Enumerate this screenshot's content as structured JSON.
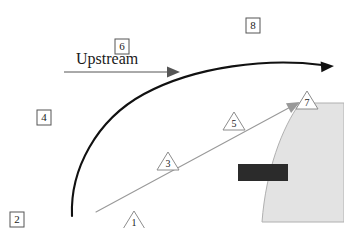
{
  "figure": {
    "type": "technical-diagram",
    "background_color": "#ffffff",
    "width": 344,
    "height": 228
  },
  "annotation_text": {
    "upstream": "Upstream"
  },
  "boxed_labels": [
    {
      "id": "box-2",
      "text": "2",
      "x": 10,
      "y": 212
    },
    {
      "id": "box-4",
      "text": "4",
      "x": 37,
      "y": 110
    },
    {
      "id": "box-6",
      "text": "6",
      "x": 115,
      "y": 39
    },
    {
      "id": "box-8",
      "text": "8",
      "x": 246,
      "y": 18
    }
  ],
  "triangle_labels": [
    {
      "id": "tri-1",
      "text": "1",
      "x": 134,
      "y": 211
    },
    {
      "id": "tri-3",
      "text": "3",
      "x": 168,
      "y": 152
    },
    {
      "id": "tri-5",
      "text": "5",
      "x": 234,
      "y": 112
    },
    {
      "id": "tri-7",
      "text": "7",
      "x": 307,
      "y": 91
    }
  ],
  "curves": {
    "bow_shock": {
      "name": "bow-shock-curve",
      "stroke": "#111111",
      "stroke_width": 2.1,
      "path": "M 72 216 C 70 170, 96 120, 144 94 C 196 66, 268 58, 322 65",
      "arrow_tip": {
        "x": 334,
        "y": 66
      }
    },
    "mach_line": {
      "name": "mach-line",
      "stroke": "#999999",
      "stroke_width": 1.1,
      "path": "M 96 212 L 296 104",
      "arrow_tip": {
        "x": 300,
        "y": 102
      }
    },
    "upstream_arrow": {
      "name": "upstream-flow-arrow",
      "stroke": "#555555",
      "stroke_width": 1,
      "path": "M 64 72 L 168 72",
      "arrow_tip": {
        "x": 180,
        "y": 72
      }
    }
  },
  "body": {
    "name": "blunt-body",
    "fill": "#e3e3e3",
    "stroke": "#b0b0b0",
    "stroke_width": 1,
    "path": "M 300 103 C 282 128, 266 170, 262 222 L 344 222 L 344 103 Z"
  },
  "dark_bar": {
    "name": "surface-sensor-bar",
    "fill": "#2b2b2b",
    "x": 238,
    "y": 164,
    "width": 50,
    "height": 17
  },
  "colors": {
    "ink": "#111111",
    "mid_gray": "#999999",
    "body_fill": "#e3e3e3",
    "body_stroke": "#b0b0b0",
    "bar_fill": "#2b2b2b",
    "box_stroke": "#555555",
    "tri_stroke": "#8c8c8c"
  }
}
